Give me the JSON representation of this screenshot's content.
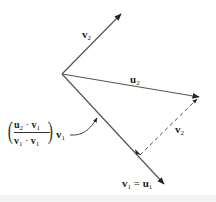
{
  "diagram": {
    "colors": {
      "line": "#555555",
      "arrowhead": "#222222",
      "text": "#222222",
      "background": "#ffffff"
    },
    "origin": [
      62,
      74
    ],
    "vectors": [
      {
        "id": "v2",
        "from": [
          62,
          74
        ],
        "to": [
          121,
          14
        ],
        "style": "solid"
      },
      {
        "id": "u2",
        "from": [
          62,
          74
        ],
        "to": [
          199,
          97
        ],
        "style": "solid"
      },
      {
        "id": "v1_eq_u1",
        "from": [
          62,
          74
        ],
        "to": [
          164,
          184
        ],
        "style": "solid"
      },
      {
        "id": "v2_translated",
        "from": [
          140,
          155
        ],
        "to": [
          199,
          97
        ],
        "style": "dashed"
      }
    ],
    "labels": {
      "v2_top": {
        "main": "v",
        "sub": "2"
      },
      "u2": {
        "main": "u",
        "sub": "2"
      },
      "v2_dashed": {
        "main": "v",
        "sub": "2"
      },
      "v1_eq_u1": {
        "left_main": "v",
        "left_sub": "1",
        "eq": " = ",
        "right_main": "u",
        "right_sub": "1"
      },
      "projection": {
        "numerator": {
          "a_main": "u",
          "a_sub": "2",
          "dot": " · ",
          "b_main": "v",
          "b_sub": "1"
        },
        "denominator": {
          "a_main": "v",
          "a_sub": "1",
          "dot": " · ",
          "b_main": "v",
          "b_sub": "1"
        },
        "trailing_main": "v",
        "trailing_sub": "1"
      }
    },
    "pointer": {
      "from": [
        70,
        135
      ],
      "to": [
        97,
        118
      ],
      "target": "projection-on-v1"
    }
  }
}
